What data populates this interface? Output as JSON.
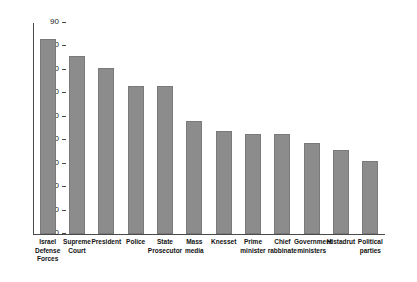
{
  "chart_data": {
    "type": "bar",
    "title": "",
    "subtitle": "",
    "xlabel": "",
    "ylabel": "",
    "ylim": [
      0,
      90
    ],
    "yticks": [
      0,
      10,
      20,
      30,
      40,
      50,
      60,
      70,
      80,
      90
    ],
    "grid": false,
    "legend": null,
    "orientation": "vertical",
    "bar_color": "#8c8c8c",
    "bar_edge_color": "#7a7a7a",
    "axis_color": "#4a4a4a",
    "categories": [
      "Israel Defense Forces",
      "Supreme Court",
      "President",
      "Police",
      "State Prosecutor",
      "Mass media",
      "Knesset",
      "Prime minister",
      "Chief rabbinate",
      "Government ministers",
      "Histadrut",
      "Political parties"
    ],
    "category_lines": [
      [
        "Israel",
        "Defense",
        "Forces"
      ],
      [
        "Supreme",
        "Court"
      ],
      [
        "President"
      ],
      [
        "Police"
      ],
      [
        "State",
        "Prosecutor"
      ],
      [
        "Mass",
        "media"
      ],
      [
        "Knesset"
      ],
      [
        "Prime",
        "minister"
      ],
      [
        "Chief",
        "rabbinate"
      ],
      [
        "Government",
        "ministers"
      ],
      [
        "Histadrut"
      ],
      [
        "Political",
        "parties"
      ]
    ],
    "values": [
      83,
      76,
      71,
      63,
      63,
      48,
      44,
      42.5,
      42.5,
      39,
      36,
      31
    ]
  }
}
